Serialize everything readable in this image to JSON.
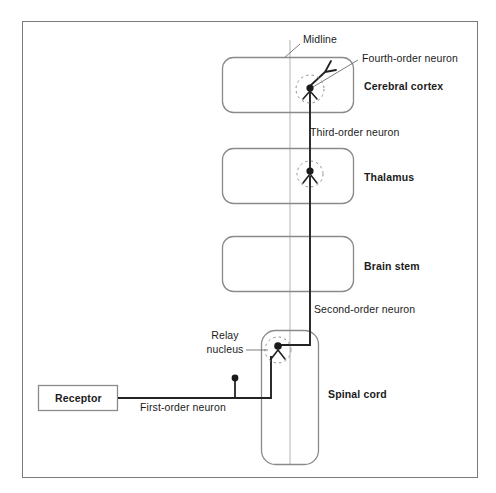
{
  "figure": {
    "type": "diagram",
    "frame": {
      "stroke": "#7a7a7a"
    },
    "colors": {
      "frame": "#7a7a7a",
      "region_box": "#8a8a8a",
      "midline": "#c9c9c9",
      "neuron": "#232323",
      "leader": "#6e6e6e",
      "soma_fill": "#1a1a1a",
      "dashed_halo": "#8c8c8c",
      "text": "#1b1b1b",
      "background": "#ffffff"
    }
  },
  "regions": [
    {
      "id": "cerebral-cortex",
      "label": "Cerebral cortex",
      "bold": true,
      "box": {
        "x": 222,
        "y": 57,
        "w": 132,
        "h": 56
      },
      "label_pos": {
        "x": 364,
        "y": 80
      }
    },
    {
      "id": "thalamus",
      "label": "Thalamus",
      "bold": true,
      "box": {
        "x": 222,
        "y": 148,
        "w": 132,
        "h": 56
      },
      "label_pos": {
        "x": 364,
        "y": 171
      }
    },
    {
      "id": "brain-stem",
      "label": "Brain stem",
      "bold": true,
      "box": {
        "x": 222,
        "y": 236,
        "w": 132,
        "h": 56
      },
      "label_pos": {
        "x": 364,
        "y": 259
      }
    },
    {
      "id": "spinal-cord",
      "label": "Spinal cord",
      "bold": true,
      "box": {
        "x": 261,
        "y": 330,
        "w": 58,
        "h": 135
      },
      "label_pos": {
        "x": 328,
        "y": 388
      }
    }
  ],
  "receptor": {
    "label": "Receptor",
    "bold": true,
    "box": {
      "x": 38,
      "y": 385,
      "w": 80,
      "h": 26
    }
  },
  "midline": {
    "label": "Midline",
    "x": 290,
    "y_top": 40,
    "y_bottom": 465,
    "label_pos": {
      "x": 303,
      "y": 34
    },
    "leader": {
      "x1": 300,
      "y1": 44,
      "x2": 284,
      "y2": 57
    }
  },
  "neurons": [
    {
      "id": "first-order-neuron",
      "label": "First-order neuron",
      "bold": false,
      "label_pos": {
        "x": 145,
        "y": 401
      },
      "soma_marker": {
        "x": 235,
        "y": 378,
        "stem_to_y": 398
      }
    },
    {
      "id": "second-order-neuron",
      "label": "Second-order neuron",
      "bold": false,
      "label_pos": {
        "x": 314,
        "y": 304
      }
    },
    {
      "id": "third-order-neuron",
      "label": "Third-order neuron",
      "bold": false,
      "label_pos": {
        "x": 310,
        "y": 127
      }
    },
    {
      "id": "fourth-order-neuron",
      "label": "Fourth-order neuron",
      "bold": false,
      "label_pos": {
        "x": 362,
        "y": 54
      },
      "leader": {
        "x1": 358,
        "y1": 60,
        "x2": 312,
        "y2": 88
      }
    }
  ],
  "relay_nucleus": {
    "label_line1": "Relay",
    "label_line2": "nucleus",
    "label_pos": {
      "x": 203,
      "y": 330
    },
    "leader": {
      "x1": 249,
      "y1": 350,
      "x2": 271,
      "y2": 350
    },
    "soma": {
      "x": 278,
      "y": 348
    }
  },
  "somas": [
    {
      "id": "cortex-soma",
      "x": 310,
      "y": 88,
      "halo_r": 14
    },
    {
      "id": "thalamus-soma",
      "x": 310,
      "y": 172,
      "halo_r": 13
    },
    {
      "id": "relay-soma",
      "x": 278,
      "y": 348,
      "halo_r": 13
    }
  ]
}
